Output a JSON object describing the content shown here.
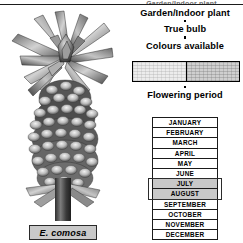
{
  "page": {
    "top_partial_text": "Garden/Indoor plant"
  },
  "illustration": {
    "alt_name": "eucomis-comosa-pineapple-lily",
    "caption": "E. comosa"
  },
  "info": {
    "headers": [
      "Garden/Indoor plant",
      "True bulb",
      "Colours available"
    ],
    "bullet_glyph": "square-bullet"
  },
  "colours": {
    "label": "Colours available",
    "swatches": [
      {
        "name": "cream-white",
        "hex": "#ECECEC"
      },
      {
        "name": "pale-green-grey",
        "hex": "#CFCFCF"
      }
    ]
  },
  "flowering": {
    "title": "Flowering period",
    "months": [
      {
        "name": "JANUARY",
        "active": false
      },
      {
        "name": "FEBRUARY",
        "active": false
      },
      {
        "name": "MARCH",
        "active": false
      },
      {
        "name": "APRIL",
        "active": false
      },
      {
        "name": "MAY",
        "active": false
      },
      {
        "name": "JUNE",
        "active": false
      },
      {
        "name": "JULY",
        "active": true
      },
      {
        "name": "AUGUST",
        "active": true
      },
      {
        "name": "SEPTEMBER",
        "active": false
      },
      {
        "name": "OCTOBER",
        "active": false
      },
      {
        "name": "NOVEMBER",
        "active": false
      },
      {
        "name": "DECEMBER",
        "active": false
      }
    ],
    "highlight_months": [
      "JULY",
      "AUGUST"
    ],
    "highlight_fill_hex": "#C8C8C8",
    "highlight_border_hex": "#2B2B2B"
  }
}
